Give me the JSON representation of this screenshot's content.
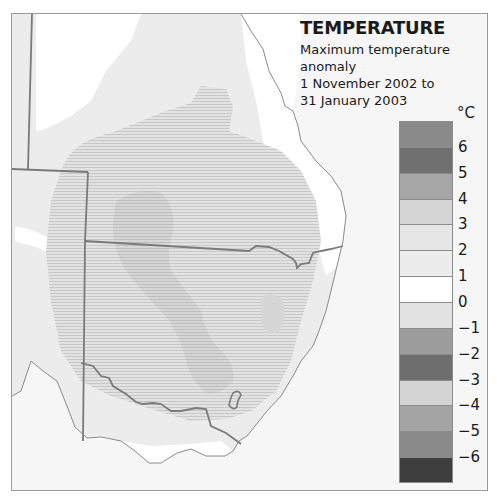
{
  "legend": {
    "title": "TEMPERATURE",
    "subtitle_lines": [
      "Maximum temperature",
      "anomaly",
      "1 November 2002 to",
      "31 January 2003"
    ],
    "unit": "°C",
    "bands": [
      {
        "range": "6 to 7",
        "color": "#8a8a8a"
      },
      {
        "range": "5 to 6",
        "color": "#707070"
      },
      {
        "range": "4 to 5",
        "color": "#a6a6a6"
      },
      {
        "range": "3 to 4",
        "color": "#d6d6d6"
      },
      {
        "range": "2 to 3",
        "color": "#e6e6e6"
      },
      {
        "range": "1 to 2",
        "color": "#ececec"
      },
      {
        "range": "0 to 1",
        "color": "#ffffff"
      },
      {
        "range": "-1 to 0",
        "color": "#e2e2e2"
      },
      {
        "range": "-2 to -1",
        "color": "#9c9c9c"
      },
      {
        "range": "-3 to -2",
        "color": "#6e6e6e"
      },
      {
        "range": "-4 to -3",
        "color": "#d4d4d4"
      },
      {
        "range": "-5 to -4",
        "color": "#a4a4a4"
      },
      {
        "range": "-6 to -5",
        "color": "#8a8a8a"
      },
      {
        "range": "-7 to -6",
        "color": "#3e3e3e"
      }
    ],
    "ticks": [
      "6",
      "5",
      "4",
      "3",
      "2",
      "1",
      "0",
      "−1",
      "−2",
      "−3",
      "−4",
      "−5",
      "−6"
    ]
  },
  "map": {
    "region": "South-eastern Australia",
    "states_visible": [
      "Queensland",
      "New South Wales",
      "Victoria",
      "South Australia",
      "Tasmania (not shown)"
    ],
    "anomaly_zones": [
      {
        "label": "0 to 1",
        "color": "#ffffff",
        "where": "coastal strip and western highlands"
      },
      {
        "label": "1 to 2",
        "color": "#ececec",
        "where": "broad inland background"
      },
      {
        "label": "2 to 3",
        "color": "#e0e0e0",
        "where": "central inland, hatched"
      },
      {
        "label": "3 to 4",
        "color": "#d3d3d3",
        "where": "inner NSW core, hatched"
      }
    ]
  }
}
